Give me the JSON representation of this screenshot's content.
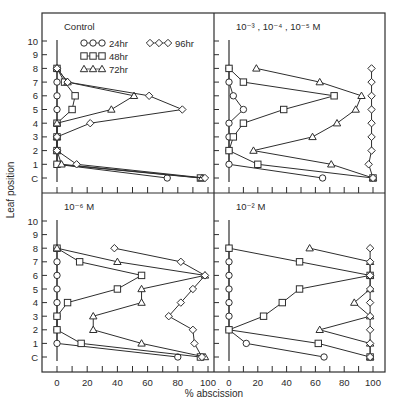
{
  "figure": {
    "ylabel": "Leaf position",
    "xlabel": "% abscission",
    "x_ticks": [
      "0",
      "20",
      "40",
      "60",
      "80",
      "100"
    ],
    "y_ticks": [
      "C",
      "1",
      "2",
      "3",
      "4",
      "5",
      "6",
      "7",
      "8",
      "9",
      "10"
    ]
  },
  "legend": [
    {
      "label": "24hr",
      "marker": "circle"
    },
    {
      "label": "48hr",
      "marker": "square"
    },
    {
      "label": "72hr",
      "marker": "triangle"
    },
    {
      "label": "96hr",
      "marker": "diamond"
    }
  ],
  "chart_data": [
    {
      "type": "line",
      "title": "Control",
      "xlabel": "% abscission",
      "ylabel": "Leaf position",
      "xlim": [
        0,
        100
      ],
      "y_categories": [
        "C",
        "1",
        "2",
        "3",
        "4",
        "5",
        "6",
        "7",
        "8",
        "9",
        "10"
      ],
      "grid": false,
      "legend_position": "upper",
      "series": [
        {
          "name": "24hr",
          "marker": "circle",
          "points": [
            [
              "8",
              0
            ],
            [
              "7",
              0
            ],
            [
              "6",
              0
            ],
            [
              "5",
              0
            ],
            [
              "4",
              0
            ],
            [
              "3",
              0
            ],
            [
              "2",
              0
            ],
            [
              "1",
              0
            ],
            [
              "C",
              73
            ]
          ]
        },
        {
          "name": "48hr",
          "marker": "square",
          "points": [
            [
              "8",
              0
            ],
            [
              "7",
              5
            ],
            [
              "6",
              12
            ],
            [
              "5",
              10
            ],
            [
              "4",
              0
            ],
            [
              "3",
              0
            ],
            [
              "2",
              0
            ],
            [
              "1",
              0
            ],
            [
              "C",
              95
            ]
          ]
        },
        {
          "name": "72hr",
          "marker": "triangle",
          "points": [
            [
              "8",
              0
            ],
            [
              "7",
              7
            ],
            [
              "6",
              51
            ],
            [
              "5",
              36
            ],
            [
              "4",
              0
            ],
            [
              "3",
              0
            ],
            [
              "2",
              0
            ],
            [
              "1",
              3
            ],
            [
              "C",
              96
            ]
          ]
        },
        {
          "name": "96hr",
          "marker": "diamond",
          "points": [
            [
              "8",
              0
            ],
            [
              "7",
              7
            ],
            [
              "6",
              61
            ],
            [
              "5",
              83
            ],
            [
              "4",
              22
            ],
            [
              "3",
              0
            ],
            [
              "2",
              0
            ],
            [
              "1",
              13
            ],
            [
              "C",
              98
            ]
          ]
        }
      ]
    },
    {
      "type": "line",
      "title": "10⁻³ , 10⁻⁴ , 10⁻⁵ M",
      "xlabel": "% abscission",
      "ylabel": "Leaf position",
      "xlim": [
        0,
        100
      ],
      "y_categories": [
        "C",
        "1",
        "2",
        "3",
        "4",
        "5",
        "6",
        "7",
        "8",
        "9",
        "10"
      ],
      "grid": false,
      "series": [
        {
          "name": "24hr",
          "marker": "circle",
          "points": [
            [
              "8",
              0
            ],
            [
              "7",
              0
            ],
            [
              "6",
              3
            ],
            [
              "5",
              10
            ],
            [
              "4",
              0
            ],
            [
              "3",
              0
            ],
            [
              "2",
              0
            ],
            [
              "1",
              0
            ],
            [
              "C",
              65
            ]
          ]
        },
        {
          "name": "48hr",
          "marker": "square",
          "points": [
            [
              "8",
              0
            ],
            [
              "7",
              10
            ],
            [
              "6",
              73
            ],
            [
              "5",
              38
            ],
            [
              "4",
              10
            ],
            [
              "3",
              3
            ],
            [
              "2",
              0
            ],
            [
              "1",
              20
            ],
            [
              "C",
              100
            ]
          ]
        },
        {
          "name": "72hr",
          "marker": "triangle",
          "points": [
            [
              "8",
              19
            ],
            [
              "7",
              63
            ],
            [
              "6",
              92
            ],
            [
              "5",
              88
            ],
            [
              "4",
              75
            ],
            [
              "3",
              58
            ],
            [
              "2",
              17
            ],
            [
              "1",
              71
            ],
            [
              "C",
              100
            ]
          ]
        },
        {
          "name": "96hr",
          "marker": "diamond",
          "points": [
            [
              "8",
              99
            ],
            [
              "7",
              99
            ],
            [
              "6",
              99
            ],
            [
              "5",
              99
            ],
            [
              "4",
              99
            ],
            [
              "3",
              99
            ],
            [
              "2",
              99
            ],
            [
              "1",
              97
            ],
            [
              "C",
              100
            ]
          ]
        }
      ]
    },
    {
      "type": "line",
      "title": "10⁻⁶ M",
      "xlabel": "% abscission",
      "ylabel": "Leaf position",
      "xlim": [
        0,
        100
      ],
      "y_categories": [
        "C",
        "1",
        "2",
        "3",
        "4",
        "5",
        "6",
        "7",
        "8",
        "9",
        "10"
      ],
      "grid": false,
      "series": [
        {
          "name": "24hr",
          "marker": "circle",
          "points": [
            [
              "8",
              0
            ],
            [
              "7",
              0
            ],
            [
              "6",
              0
            ],
            [
              "5",
              0
            ],
            [
              "4",
              0
            ],
            [
              "3",
              0
            ],
            [
              "2",
              0
            ],
            [
              "1",
              0
            ],
            [
              "C",
              80
            ]
          ]
        },
        {
          "name": "48hr",
          "marker": "square",
          "points": [
            [
              "8",
              0
            ],
            [
              "7",
              15
            ],
            [
              "6",
              56
            ],
            [
              "5",
              40
            ],
            [
              "4",
              7
            ],
            [
              "3",
              0
            ],
            [
              "2",
              0
            ],
            [
              "1",
              16
            ],
            [
              "C",
              95
            ]
          ]
        },
        {
          "name": "72hr",
          "marker": "triangle",
          "points": [
            [
              "8",
              0
            ],
            [
              "7",
              40
            ],
            [
              "6",
              98
            ],
            [
              "5",
              56
            ],
            [
              "4",
              56
            ],
            [
              "3",
              24
            ],
            [
              "2",
              24
            ],
            [
              "1",
              56
            ],
            [
              "C",
              98
            ]
          ]
        },
        {
          "name": "96hr",
          "marker": "diamond",
          "points": [
            [
              "8",
              38
            ],
            [
              "7",
              82
            ],
            [
              "6",
              98
            ],
            [
              "5",
              90
            ],
            [
              "4",
              82
            ],
            [
              "3",
              74
            ],
            [
              "2",
              90
            ],
            [
              "1",
              91
            ],
            [
              "C",
              96
            ]
          ]
        }
      ]
    },
    {
      "type": "line",
      "title": "10⁻² M",
      "xlabel": "% abscission",
      "ylabel": "Leaf position",
      "xlim": [
        0,
        100
      ],
      "y_categories": [
        "C",
        "1",
        "2",
        "3",
        "4",
        "5",
        "6",
        "7",
        "8",
        "9",
        "10"
      ],
      "grid": false,
      "series": [
        {
          "name": "24hr",
          "marker": "circle",
          "points": [
            [
              "8",
              0
            ],
            [
              "7",
              0
            ],
            [
              "6",
              0
            ],
            [
              "5",
              0
            ],
            [
              "4",
              0
            ],
            [
              "3",
              0
            ],
            [
              "2",
              0
            ],
            [
              "1",
              12
            ],
            [
              "C",
              66
            ]
          ]
        },
        {
          "name": "48hr",
          "marker": "square",
          "points": [
            [
              "8",
              0
            ],
            [
              "7",
              49
            ],
            [
              "6",
              98
            ],
            [
              "5",
              49
            ],
            [
              "4",
              37
            ],
            [
              "3",
              24
            ],
            [
              "2",
              0
            ],
            [
              "1",
              62
            ],
            [
              "C",
              98
            ]
          ]
        },
        {
          "name": "72hr",
          "marker": "triangle",
          "points": [
            [
              "8",
              56
            ],
            [
              "7",
              98
            ],
            [
              "6",
              98
            ],
            [
              "5",
              98
            ],
            [
              "4",
              87
            ],
            [
              "3",
              98
            ],
            [
              "2",
              63
            ],
            [
              "1",
              98
            ],
            [
              "C",
              98
            ]
          ]
        },
        {
          "name": "96hr",
          "marker": "diamond",
          "points": [
            [
              "8",
              98
            ],
            [
              "7",
              98
            ],
            [
              "6",
              98
            ],
            [
              "5",
              98
            ],
            [
              "4",
              98
            ],
            [
              "3",
              98
            ],
            [
              "2",
              98
            ],
            [
              "1",
              98
            ],
            [
              "C",
              98
            ]
          ]
        }
      ]
    }
  ]
}
